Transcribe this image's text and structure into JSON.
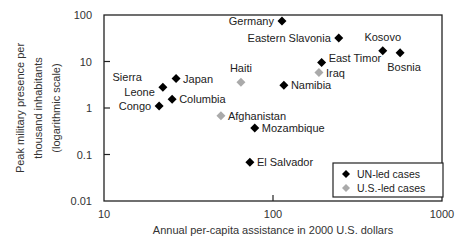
{
  "chart_data": {
    "type": "scatter",
    "title": "",
    "xlabel": "Annual per-capita assistance in 2000 U.S. dollars",
    "ylabel": [
      "Peak military presence per",
      "thousand inhabitants",
      "(logarithmic scale)"
    ],
    "xscale": "log",
    "yscale": "log",
    "xlim": [
      10,
      1000
    ],
    "ylim": [
      0.01,
      100
    ],
    "xticks": [
      10,
      100,
      1000
    ],
    "xtick_labels": [
      "10",
      "100",
      "1000"
    ],
    "yticks": [
      0.01,
      0.1,
      1,
      10,
      100
    ],
    "ytick_labels": [
      "0.01",
      "0.1",
      "1",
      "10",
      "100"
    ],
    "grid": false,
    "legend_position": "lower right",
    "series": [
      {
        "name": "UN-led cases",
        "color": "#000000",
        "marker": "diamond",
        "points": [
          {
            "label": "Germany",
            "x": 113,
            "y": 74,
            "label_pos": "left"
          },
          {
            "label": "Eastern Slavonia",
            "x": 245,
            "y": 32,
            "label_pos": "left"
          },
          {
            "label": "Kosovo",
            "x": 446,
            "y": 17,
            "label_pos": "above"
          },
          {
            "label": "Bosnia",
            "x": 565,
            "y": 15.5,
            "label_pos": "below-right"
          },
          {
            "label": "East Timor",
            "x": 194,
            "y": 9.5,
            "label_pos": "right-up"
          },
          {
            "label": "Japan",
            "x": 26.7,
            "y": 4.3,
            "label_pos": "right"
          },
          {
            "label": "Namibia",
            "x": 116,
            "y": 3.1,
            "label_pos": "right"
          },
          {
            "label": "Sierra Leone",
            "x": 22.3,
            "y": 2.8,
            "label_pos": "left"
          },
          {
            "label": "Columbia",
            "x": 25.3,
            "y": 1.55,
            "label_pos": "right"
          },
          {
            "label": "Congo",
            "x": 21.2,
            "y": 1.1,
            "label_pos": "left"
          },
          {
            "label": "Mozambique",
            "x": 78,
            "y": 0.37,
            "label_pos": "right"
          },
          {
            "label": "El Salvador",
            "x": 73,
            "y": 0.068,
            "label_pos": "right"
          }
        ]
      },
      {
        "name": "U.S.-led cases",
        "color": "#999999",
        "marker": "diamond",
        "points": [
          {
            "label": "Iraq",
            "x": 187,
            "y": 5.8,
            "label_pos": "right"
          },
          {
            "label": "Haiti",
            "x": 64.6,
            "y": 3.6,
            "label_pos": "above"
          },
          {
            "label": "Afghanistan",
            "x": 49.2,
            "y": 0.68,
            "label_pos": "right"
          }
        ]
      }
    ]
  },
  "legend": {
    "items": [
      {
        "label": "UN-led cases",
        "color": "#000000"
      },
      {
        "label": "U.S.-led cases",
        "color": "#999999"
      }
    ]
  }
}
